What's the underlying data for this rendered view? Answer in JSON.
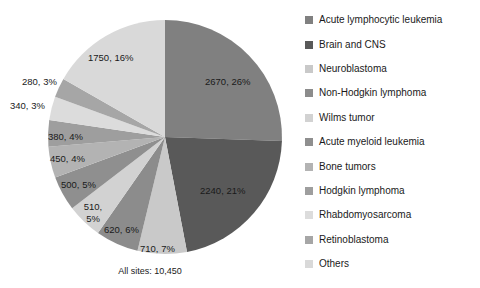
{
  "chart_data": {
    "type": "pie",
    "title": "",
    "subtitle": "",
    "xlabel": "",
    "ylabel": "",
    "legend_position": "right",
    "grid": false,
    "total_label": "All sites: 10,450",
    "total_value": 10450,
    "start_angle_deg": 0,
    "direction": "clockwise",
    "categories": [
      "Acute lymphocytic leukemia",
      "Brain and CNS",
      "Neuroblastoma",
      "Non-Hodgkin lymphoma",
      "Wilms tumor",
      "Acute myeloid leukemia",
      "Bone tumors",
      "Hodgkin lymphoma",
      "Rhabdomyosarcoma",
      "Retinoblastoma",
      "Others"
    ],
    "values": [
      2670,
      2240,
      710,
      620,
      510,
      500,
      450,
      380,
      340,
      280,
      1750
    ],
    "percentages": [
      26,
      21,
      7,
      6,
      5,
      5,
      4,
      4,
      3,
      3,
      16
    ],
    "colors": [
      "#808080",
      "#595959",
      "#c9c9c9",
      "#8c8c8c",
      "#d2d2d2",
      "#8f8f8f",
      "#b3b3b3",
      "#9e9e9e",
      "#dcdcdc",
      "#a6a6a6",
      "#d9d9d9"
    ],
    "data_labels": [
      "2670, 26%",
      "2240, 21%",
      "710, 7%",
      "620, 6%",
      "510,\n5%",
      "500, 5%",
      "450, 4%",
      "380, 4%",
      "340, 3%",
      "280, 3%",
      "1750, 16%"
    ]
  },
  "pie": {
    "labels": [
      {
        "text": "2670, 26%",
        "left": 205,
        "top": 76
      },
      {
        "text": "2240, 21%",
        "left": 200,
        "top": 185
      },
      {
        "text": "710, 7%",
        "left": 140,
        "top": 243
      },
      {
        "text": "620, 6%",
        "left": 104,
        "top": 224
      },
      {
        "text_line1": "510,",
        "text_line2": "5%",
        "left": 80,
        "top": 201
      },
      {
        "text": "500, 5%",
        "left": 61,
        "top": 179
      },
      {
        "text": "450, 4%",
        "left": 50,
        "top": 153
      },
      {
        "text": "380, 4%",
        "left": 48,
        "top": 131
      },
      {
        "text": "340, 3%",
        "left": 10,
        "top": 100
      },
      {
        "text": "280, 3%",
        "left": 22,
        "top": 76
      },
      {
        "text": "1750, 16%",
        "left": 88,
        "top": 52
      }
    ],
    "caption": "All sites: 10,450"
  },
  "legend": {
    "items": [
      {
        "label": "Acute lymphocytic  leukemia",
        "color": "#808080"
      },
      {
        "label": "Brain and CNS",
        "color": "#595959"
      },
      {
        "label": "Neuroblastoma",
        "color": "#c9c9c9"
      },
      {
        "label": "Non-Hodgkin lymphoma",
        "color": "#8c8c8c"
      },
      {
        "label": "Wilms tumor",
        "color": "#d2d2d2"
      },
      {
        "label": "Acute myeloid  leukemia",
        "color": "#8f8f8f"
      },
      {
        "label": "Bone tumors",
        "color": "#b3b3b3"
      },
      {
        "label": "Hodgkin lymphoma",
        "color": "#9e9e9e"
      },
      {
        "label": "Rhabdomyosarcoma",
        "color": "#dcdcdc"
      },
      {
        "label": "Retinoblastoma",
        "color": "#a6a6a6"
      },
      {
        "label": "Others",
        "color": "#d9d9d9"
      }
    ]
  }
}
